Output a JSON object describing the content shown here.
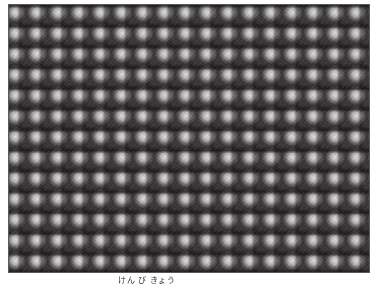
{
  "figure": {
    "pattern": {
      "columns_visible": 17,
      "rows_visible": 13,
      "spot_color": "#e6e6e6",
      "background_color": "#3b3637"
    },
    "border_color": "#5a5a5a"
  },
  "caption": {
    "text": "けん び きょう"
  }
}
